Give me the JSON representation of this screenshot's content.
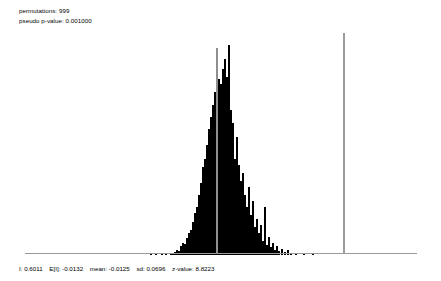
{
  "header": {
    "permutations_label": "permutations: 999",
    "pvalue_label": "pseudo p-value: 0.001000"
  },
  "footer": {
    "i_label": "I: 0.6011",
    "ei_label": "E[I]: -0.0132",
    "mean_label": "mean: -0.0125",
    "sd_label": "sd: 0.0696",
    "z_label": "z-value: 8.8223"
  },
  "colors": {
    "bar": "#000000",
    "axis": "#9a9a9a",
    "mean_line": "#8f8f8f",
    "observed_line": "#9b9b9b",
    "background": "#ffffff",
    "text": "#000000"
  },
  "chart_data": {
    "type": "bar",
    "title": "",
    "subtitle": "",
    "xlabel": "",
    "ylabel": "",
    "grid": false,
    "legend": null,
    "statistics": {
      "permutations": 999,
      "pseudo_p_value": 0.001,
      "I": 0.6011,
      "E_I": -0.0132,
      "mean": -0.0125,
      "sd": 0.0696,
      "z_value": 8.8223
    },
    "reference_lines": [
      {
        "name": "mean",
        "x_px": 216,
        "color": "#8f8f8f"
      },
      {
        "name": "observed-I",
        "x_px": 343,
        "color": "#9b9b9b"
      }
    ],
    "axis_px": {
      "x0": 25,
      "x1": 417,
      "baseline_y": 253,
      "top_y": 30
    },
    "bar_width_px": 2.4,
    "ylim": [
      0,
      64
    ],
    "bins_px_heights": [
      [
        150,
        1
      ],
      [
        155,
        1
      ],
      [
        161,
        2
      ],
      [
        165,
        1
      ],
      [
        170,
        1
      ],
      [
        172,
        2
      ],
      [
        174,
        3
      ],
      [
        176,
        5
      ],
      [
        178,
        4
      ],
      [
        180,
        9
      ],
      [
        182,
        12
      ],
      [
        184,
        11
      ],
      [
        186,
        17
      ],
      [
        188,
        22
      ],
      [
        190,
        25
      ],
      [
        192,
        33
      ],
      [
        194,
        42
      ],
      [
        196,
        48
      ],
      [
        198,
        60
      ],
      [
        200,
        72
      ],
      [
        202,
        88
      ],
      [
        204,
        96
      ],
      [
        206,
        110
      ],
      [
        208,
        126
      ],
      [
        210,
        138
      ],
      [
        212,
        150
      ],
      [
        214,
        163
      ],
      [
        216,
        155
      ],
      [
        218,
        176
      ],
      [
        220,
        171
      ],
      [
        222,
        186
      ],
      [
        224,
        196
      ],
      [
        226,
        178
      ],
      [
        228,
        210
      ],
      [
        230,
        145
      ],
      [
        232,
        132
      ],
      [
        234,
        96
      ],
      [
        236,
        118
      ],
      [
        238,
        90
      ],
      [
        240,
        74
      ],
      [
        242,
        82
      ],
      [
        244,
        60
      ],
      [
        246,
        48
      ],
      [
        248,
        68
      ],
      [
        250,
        40
      ],
      [
        252,
        54
      ],
      [
        254,
        28
      ],
      [
        256,
        36
      ],
      [
        258,
        22
      ],
      [
        260,
        30
      ],
      [
        262,
        14
      ],
      [
        264,
        48
      ],
      [
        266,
        10
      ],
      [
        268,
        18
      ],
      [
        270,
        8
      ],
      [
        272,
        12
      ],
      [
        274,
        5
      ],
      [
        276,
        9
      ],
      [
        278,
        4
      ],
      [
        281,
        6
      ],
      [
        284,
        3
      ],
      [
        287,
        5
      ],
      [
        290,
        2
      ],
      [
        295,
        1
      ],
      [
        303,
        2
      ],
      [
        312,
        1
      ]
    ]
  }
}
